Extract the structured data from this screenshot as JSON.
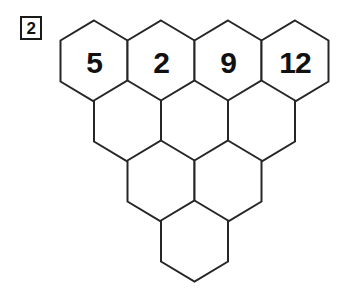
{
  "problem": {
    "number": "2"
  },
  "puzzle": {
    "type": "hexagon-pyramid",
    "rows": [
      {
        "index": 0,
        "cells": [
          {
            "id": "r0c0",
            "value": "5"
          },
          {
            "id": "r0c1",
            "value": "2"
          },
          {
            "id": "r0c2",
            "value": "9"
          },
          {
            "id": "r0c3",
            "value": "12"
          }
        ]
      },
      {
        "index": 1,
        "cells": [
          {
            "id": "r1c0",
            "value": ""
          },
          {
            "id": "r1c1",
            "value": ""
          },
          {
            "id": "r1c2",
            "value": ""
          }
        ]
      },
      {
        "index": 2,
        "cells": [
          {
            "id": "r2c0",
            "value": ""
          },
          {
            "id": "r2c1",
            "value": ""
          }
        ]
      },
      {
        "index": 3,
        "cells": [
          {
            "id": "r3c0",
            "value": ""
          }
        ]
      }
    ]
  },
  "geometry": {
    "origin_x": 94,
    "origin_y": 61,
    "pitch_x": 67,
    "pitch_y": 60,
    "half_width": 33.5,
    "half_height": 40.5,
    "side_half": 20.5
  },
  "colors": {
    "stroke": "#262626",
    "fill": "#ffffff",
    "text": "#111111",
    "background": "#ffffff"
  }
}
